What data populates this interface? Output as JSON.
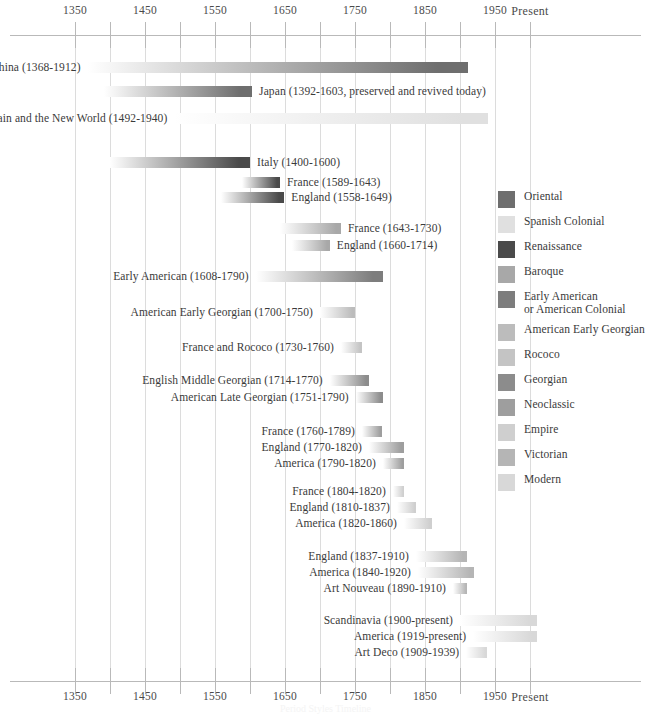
{
  "axis": {
    "tick_labels": [
      "1350",
      "1450",
      "1550",
      "1650",
      "1750",
      "1850",
      "1950",
      "Present"
    ],
    "tick_years": [
      1350,
      1450,
      1550,
      1650,
      1750,
      1850,
      1950,
      2000
    ],
    "minor_tick_years": [
      1350,
      1400,
      1450,
      1500,
      1550,
      1600,
      1650,
      1700,
      1750,
      1800,
      1850,
      1900,
      1950,
      2000
    ],
    "present_label": "Present"
  },
  "footnote": "Period Styles Timeline",
  "chart_data": {
    "type": "bar",
    "xlabel": "",
    "ylabel": "",
    "xlim": [
      1350,
      2000
    ],
    "grid": true,
    "orientation": "horizontal-gantt",
    "legend_position": "right",
    "categories": [
      "China (1368-1912)",
      "Japan (1392-1603, preserved and revived today)",
      "Spain and the New World (1492-1940)",
      "Italy (1400-1600)",
      "France (1589-1643)",
      "England (1558-1649)",
      "France (1643-1730)",
      "England (1660-1714)",
      "Early American (1608-1790)",
      "American Early Georgian  (1700-1750)",
      "France and Rococo (1730-1760)",
      "English Middle Georgian (1714-1770)",
      "American Late Georgian (1751-1790)",
      "France (1760-1789)",
      "England (1770-1820)",
      "America (1790-1820)",
      "France (1804-1820)",
      "England (1810-1837)",
      "America (1820-1860)",
      "England (1837-1910)",
      "America (1840-1920)",
      "Art Nouveau (1890-1910)",
      "Scandinavia (1900-present)",
      "America (1919-present)",
      "Art Deco (1909-1939)"
    ],
    "bars": [
      {
        "label": "China (1368-1912)",
        "start": 1368,
        "end": 1912,
        "style": "Oriental",
        "label_side": "left",
        "y": 60
      },
      {
        "label": "Japan (1392-1603, preserved and revived today)",
        "start": 1392,
        "end": 1603,
        "style": "Oriental",
        "label_side": "right",
        "y": 84
      },
      {
        "label": "Spain and the New World (1492-1940)",
        "start": 1492,
        "end": 1940,
        "style": "Spanish Colonial",
        "label_side": "left",
        "y": 111
      },
      {
        "label": "Italy (1400-1600)",
        "start": 1400,
        "end": 1600,
        "style": "Renaissance",
        "label_side": "right",
        "y": 155
      },
      {
        "label": "France (1589-1643)",
        "start": 1589,
        "end": 1643,
        "style": "Renaissance",
        "label_side": "right",
        "y": 175
      },
      {
        "label": "England (1558-1649)",
        "start": 1558,
        "end": 1649,
        "style": "Renaissance",
        "label_side": "right",
        "y": 190
      },
      {
        "label": "France (1643-1730)",
        "start": 1643,
        "end": 1730,
        "style": "Baroque",
        "label_side": "right",
        "y": 221
      },
      {
        "label": "England (1660-1714)",
        "start": 1660,
        "end": 1714,
        "style": "Baroque",
        "label_side": "right",
        "y": 238
      },
      {
        "label": "Early American (1608-1790)",
        "start": 1608,
        "end": 1790,
        "style": "Early American or American Colonial",
        "label_side": "left",
        "y": 269
      },
      {
        "label": "American Early Georgian  (1700-1750)",
        "start": 1700,
        "end": 1750,
        "style": "American Early Georgian",
        "label_side": "left",
        "y": 305
      },
      {
        "label": "France and Rococo (1730-1760)",
        "start": 1730,
        "end": 1760,
        "style": "Rococo",
        "label_side": "left",
        "y": 340
      },
      {
        "label": "English Middle Georgian (1714-1770)",
        "start": 1714,
        "end": 1770,
        "style": "Georgian",
        "label_side": "left",
        "y": 373
      },
      {
        "label": "American Late Georgian (1751-1790)",
        "start": 1751,
        "end": 1790,
        "style": "Georgian",
        "label_side": "left",
        "y": 390
      },
      {
        "label": "France (1760-1789)",
        "start": 1760,
        "end": 1789,
        "style": "Neoclassic",
        "label_side": "left",
        "y": 424
      },
      {
        "label": "England (1770-1820)",
        "start": 1770,
        "end": 1820,
        "style": "Neoclassic",
        "label_side": "left",
        "y": 440
      },
      {
        "label": "America (1790-1820)",
        "start": 1790,
        "end": 1820,
        "style": "Neoclassic",
        "label_side": "left",
        "y": 456
      },
      {
        "label": "France (1804-1820)",
        "start": 1804,
        "end": 1820,
        "style": "Empire",
        "label_side": "left",
        "y": 484
      },
      {
        "label": "England (1810-1837)",
        "start": 1810,
        "end": 1837,
        "style": "Empire",
        "label_side": "left",
        "y": 500
      },
      {
        "label": "America (1820-1860)",
        "start": 1820,
        "end": 1860,
        "style": "Empire",
        "label_side": "left",
        "y": 516
      },
      {
        "label": "England (1837-1910)",
        "start": 1837,
        "end": 1910,
        "style": "Victorian",
        "label_side": "left",
        "y": 549
      },
      {
        "label": "America (1840-1920)",
        "start": 1840,
        "end": 1920,
        "style": "Victorian",
        "label_side": "left",
        "y": 565
      },
      {
        "label": "Art Nouveau (1890-1910)",
        "start": 1890,
        "end": 1910,
        "style": "Victorian",
        "label_side": "left",
        "y": 581
      },
      {
        "label": "Scandinavia (1900-present)",
        "start": 1900,
        "end": 2010,
        "style": "Modern",
        "label_side": "left",
        "y": 613
      },
      {
        "label": "America (1919-present)",
        "start": 1919,
        "end": 2010,
        "style": "Modern",
        "label_side": "left",
        "y": 629
      },
      {
        "label": "Art Deco (1909-1939)",
        "start": 1909,
        "end": 1939,
        "style": "Modern",
        "label_side": "left",
        "y": 645
      }
    ]
  },
  "legend": {
    "items": [
      {
        "label": "Oriental",
        "color": "#6e6e6e"
      },
      {
        "label": "Spanish Colonial",
        "color": "#e0e0e0"
      },
      {
        "label": "Renaissance",
        "color": "#4a4a4a"
      },
      {
        "label": "Baroque",
        "color": "#a8a8a8"
      },
      {
        "label": "Early American\nor American Colonial",
        "color": "#7d7d7d"
      },
      {
        "label": "American Early Georgian",
        "color": "#bcbcbc"
      },
      {
        "label": "Rococo",
        "color": "#c4c4c4"
      },
      {
        "label": "Georgian",
        "color": "#8c8c8c"
      },
      {
        "label": "Neoclassic",
        "color": "#9e9e9e"
      },
      {
        "label": "Empire",
        "color": "#cfcfcf"
      },
      {
        "label": "Victorian",
        "color": "#b5b5b5"
      },
      {
        "label": "Modern",
        "color": "#d8d8d8"
      }
    ]
  }
}
